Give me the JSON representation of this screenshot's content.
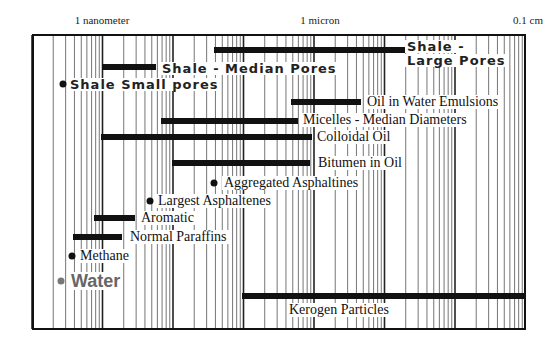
{
  "chart_data": {
    "type": "range-bar",
    "title": "",
    "xscale": "log",
    "xunit": "meters",
    "xlim_m": [
      1e-10,
      0.001
    ],
    "x_tick_labels": [
      {
        "label": "1 nanometer",
        "value_m": 1e-09
      },
      {
        "label": "1 micron",
        "value_m": 1e-06
      },
      {
        "label": "0.1 cm",
        "value_m": 0.001
      }
    ],
    "grid": "log minor and major vertical lines",
    "series": [
      {
        "name": "Shale - Large Pores",
        "kind": "range",
        "min_m": 2e-08,
        "max_m": 1e-06
      },
      {
        "name": "Shale - Median Pores",
        "kind": "range",
        "min_m": 1e-09,
        "max_m": 5.5e-09
      },
      {
        "name": "Shale Small pores",
        "kind": "point",
        "value_m": 1.5e-10
      },
      {
        "name": "Oil in Water Emulsions",
        "kind": "range",
        "min_m": 3e-07,
        "max_m": 2.8e-06
      },
      {
        "name": "Micelles - Median Diameters",
        "kind": "range",
        "min_m": 6e-09,
        "max_m": 4e-07
      },
      {
        "name": "Colloidal Oil",
        "kind": "range",
        "min_m": 1e-09,
        "max_m": 6e-07
      },
      {
        "name": "Bitumen in Oil",
        "kind": "range",
        "min_m": 1e-08,
        "max_m": 5.5e-07
      },
      {
        "name": "Aggregated Asphaltines",
        "kind": "point",
        "value_m": 2e-08
      },
      {
        "name": "Largest Asphaltenes",
        "kind": "point",
        "value_m": 4.6e-09
      },
      {
        "name": "Aromatic",
        "kind": "range",
        "min_m": 8e-10,
        "max_m": 3.2e-09
      },
      {
        "name": "Normal Paraffins",
        "kind": "range",
        "min_m": 5e-10,
        "max_m": 2.3e-09
      },
      {
        "name": "Methane",
        "kind": "point",
        "value_m": 3.8e-10
      },
      {
        "name": "Water",
        "kind": "point",
        "value_m": 2.7e-10
      },
      {
        "name": "Kerogen Particles",
        "kind": "range",
        "min_m": 1e-07,
        "max_m": 0.001
      }
    ]
  },
  "axis": {
    "nm": "1 nanometer",
    "micron": "1 micron",
    "cm": "0.1 cm"
  },
  "labels": {
    "shale_large_1": "Shale -",
    "shale_large_2": "Large Pores",
    "shale_median": "Shale - Median Pores",
    "shale_small": "Shale Small pores",
    "oil_water": "Oil in Water Emulsions",
    "micelles": "Micelles - Median Diameters",
    "colloidal": "Colloidal Oil",
    "bitumen": "Bitumen in Oil",
    "agg_asph": "Aggregated Asphaltines",
    "largest_asph": "Largest Asphaltenes",
    "aromatic": "Aromatic",
    "paraffins": "Normal Paraffins",
    "methane": "Methane",
    "water": "Water",
    "kerogen": "Kerogen Particles"
  },
  "colors": {
    "bar": "#111111",
    "grid": "#555555",
    "water": "#666666"
  }
}
